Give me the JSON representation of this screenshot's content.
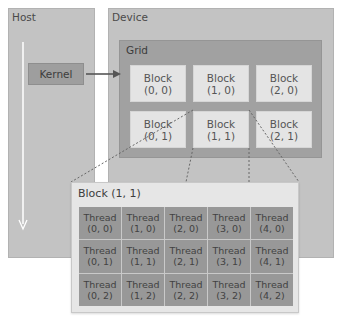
{
  "host": {
    "label": "Host",
    "kernel_label": "Kernel"
  },
  "device": {
    "label": "Device",
    "grid": {
      "label": "Grid",
      "blocks": [
        {
          "title": "Block",
          "coord": "(0, 0)"
        },
        {
          "title": "Block",
          "coord": "(1, 0)"
        },
        {
          "title": "Block",
          "coord": "(2, 0)"
        },
        {
          "title": "Block",
          "coord": "(0, 1)"
        },
        {
          "title": "Block",
          "coord": "(1, 1)"
        },
        {
          "title": "Block",
          "coord": "(2, 1)"
        }
      ]
    }
  },
  "block_detail": {
    "label": "Block (1, 1)",
    "threads": [
      {
        "title": "Thread",
        "coord": "(0, 0)"
      },
      {
        "title": "Thread",
        "coord": "(1, 0)"
      },
      {
        "title": "Thread",
        "coord": "(2, 0)"
      },
      {
        "title": "Thread",
        "coord": "(3, 0)"
      },
      {
        "title": "Thread",
        "coord": "(4, 0)"
      },
      {
        "title": "Thread",
        "coord": "(0, 1)"
      },
      {
        "title": "Thread",
        "coord": "(1, 1)"
      },
      {
        "title": "Thread",
        "coord": "(2, 1)"
      },
      {
        "title": "Thread",
        "coord": "(3, 1)"
      },
      {
        "title": "Thread",
        "coord": "(4, 1)"
      },
      {
        "title": "Thread",
        "coord": "(0, 2)"
      },
      {
        "title": "Thread",
        "coord": "(1, 2)"
      },
      {
        "title": "Thread",
        "coord": "(2, 2)"
      },
      {
        "title": "Thread",
        "coord": "(3, 2)"
      },
      {
        "title": "Thread",
        "coord": "(4, 2)"
      }
    ]
  },
  "colors": {
    "panel": "#c3c3c3",
    "kernel": "#9e9e9e",
    "grid": "#a1a1a1",
    "block": "#e4e4e4",
    "thread": "#989898",
    "arrow": "#555555"
  }
}
